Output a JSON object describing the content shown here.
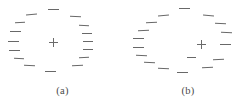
{
  "figure": {
    "background_color": "#ffffff",
    "dash_color": "#5b5b5b",
    "cross_color": "#6a6a6a",
    "caption_color": "#4a4a4a",
    "width": 251,
    "height": 109
  },
  "panels": [
    {
      "id": "a",
      "caption": "(a)",
      "fixation_cross": {
        "x": 53,
        "y": 42,
        "label": "+"
      },
      "dash_count": 16,
      "dashes": [
        {
          "x": 53,
          "y": 9,
          "length": 11,
          "angle": 0
        },
        {
          "x": 31,
          "y": 14,
          "length": 11,
          "angle": -4
        },
        {
          "x": 20,
          "y": 22,
          "length": 10,
          "angle": -2
        },
        {
          "x": 15,
          "y": 31,
          "length": 11,
          "angle": 0
        },
        {
          "x": 13,
          "y": 41,
          "length": 11,
          "angle": 0
        },
        {
          "x": 14,
          "y": 50,
          "length": 11,
          "angle": 0
        },
        {
          "x": 19,
          "y": 58,
          "length": 10,
          "angle": 3
        },
        {
          "x": 29,
          "y": 65,
          "length": 11,
          "angle": 2
        },
        {
          "x": 50,
          "y": 71,
          "length": 11,
          "angle": 0
        },
        {
          "x": 77,
          "y": 65,
          "length": 11,
          "angle": -2
        },
        {
          "x": 84,
          "y": 57,
          "length": 10,
          "angle": -2
        },
        {
          "x": 88,
          "y": 49,
          "length": 10,
          "angle": 0
        },
        {
          "x": 88,
          "y": 41,
          "length": 10,
          "angle": 0
        },
        {
          "x": 87,
          "y": 33,
          "length": 10,
          "angle": 0
        },
        {
          "x": 84,
          "y": 25,
          "length": 10,
          "angle": 2
        },
        {
          "x": 75,
          "y": 16,
          "length": 11,
          "angle": 3
        }
      ]
    },
    {
      "id": "b",
      "caption": "(b)",
      "fixation_cross": {
        "x": 76,
        "y": 44,
        "label": "+"
      },
      "dash_count": 17,
      "dashes": [
        {
          "x": 59,
          "y": 8,
          "length": 11,
          "angle": 0
        },
        {
          "x": 38,
          "y": 15,
          "length": 11,
          "angle": -4
        },
        {
          "x": 26,
          "y": 22,
          "length": 11,
          "angle": -3
        },
        {
          "x": 18,
          "y": 30,
          "length": 11,
          "angle": -2
        },
        {
          "x": 13,
          "y": 38,
          "length": 11,
          "angle": 0
        },
        {
          "x": 13,
          "y": 47,
          "length": 11,
          "angle": 0
        },
        {
          "x": 16,
          "y": 55,
          "length": 11,
          "angle": 2
        },
        {
          "x": 24,
          "y": 62,
          "length": 11,
          "angle": 3
        },
        {
          "x": 38,
          "y": 68,
          "length": 11,
          "angle": 2
        },
        {
          "x": 57,
          "y": 72,
          "length": 11,
          "angle": 0
        },
        {
          "x": 82,
          "y": 67,
          "length": 11,
          "angle": -2
        },
        {
          "x": 93,
          "y": 59,
          "length": 11,
          "angle": -3
        },
        {
          "x": 100,
          "y": 44,
          "length": 11,
          "angle": 0
        },
        {
          "x": 101,
          "y": 32,
          "length": 11,
          "angle": 2
        },
        {
          "x": 95,
          "y": 23,
          "length": 11,
          "angle": 3
        },
        {
          "x": 83,
          "y": 15,
          "length": 11,
          "angle": 4
        },
        {
          "x": 66,
          "y": 57,
          "length": 9,
          "angle": 0
        }
      ]
    }
  ]
}
